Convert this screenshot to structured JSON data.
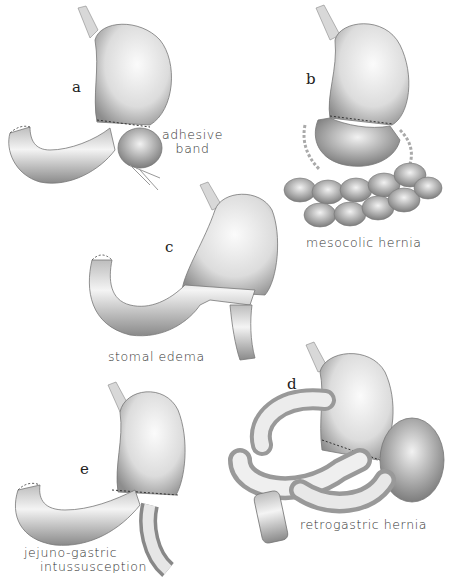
{
  "figure": {
    "panels": [
      {
        "id": "a",
        "letter": "a",
        "caption_line1": "adhesive",
        "caption_line2": "band"
      },
      {
        "id": "b",
        "letter": "b",
        "caption_line1": "mesocolic hernia"
      },
      {
        "id": "c",
        "letter": "c",
        "caption_line1": "stomal edema"
      },
      {
        "id": "d",
        "letter": "d",
        "caption_line1": "retrogastric hernia"
      },
      {
        "id": "e",
        "letter": "e",
        "caption_line1": "jejuno-gastric",
        "caption_line2": "intussusception"
      }
    ],
    "colors": {
      "ink": "#333333",
      "shade": "#9a9a9a",
      "light": "#e6e6e6",
      "background": "#ffffff"
    }
  }
}
